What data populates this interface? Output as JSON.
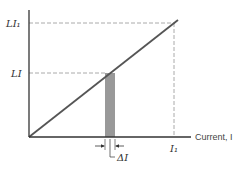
{
  "diagram": {
    "x_axis_label": "Current, I",
    "y_tick_labels": {
      "upper": "LI₁",
      "lower": "LI"
    },
    "x_tick_label": "I₁",
    "delta_label": "ΔI",
    "colors": {
      "line": "#555555",
      "axis": "#333333",
      "dash": "#aaaaaa",
      "shade": "#999999"
    }
  }
}
